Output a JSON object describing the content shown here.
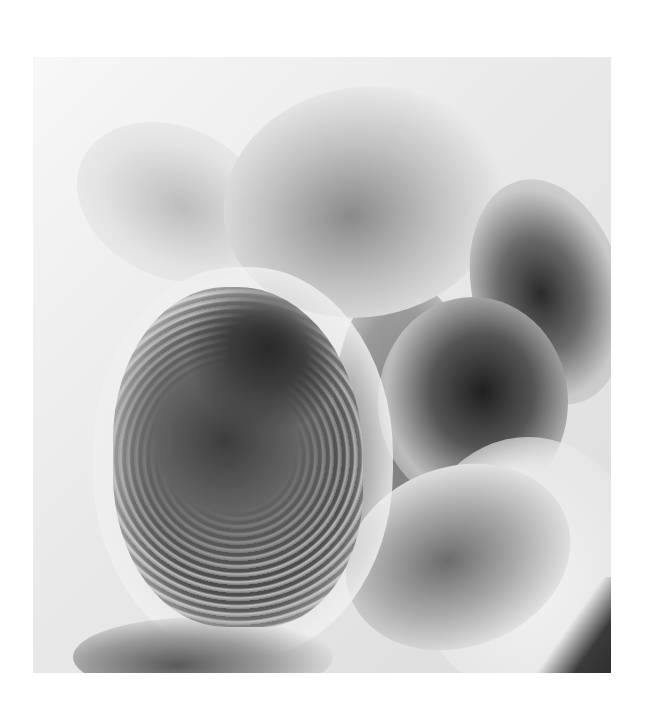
{
  "image": {
    "description": "Grayscale inverted-tone barium contrast radiograph of colon loops with a dark reticular mass region lower-left-center",
    "palette": {
      "background": "#ffffff",
      "light_tissue": "#eeeeee",
      "mid_grey": "#9a9a9a",
      "dark_lumen": "#1f1f1f"
    },
    "frame": {
      "x": 33,
      "y": 57,
      "width": 578,
      "height": 616
    }
  }
}
